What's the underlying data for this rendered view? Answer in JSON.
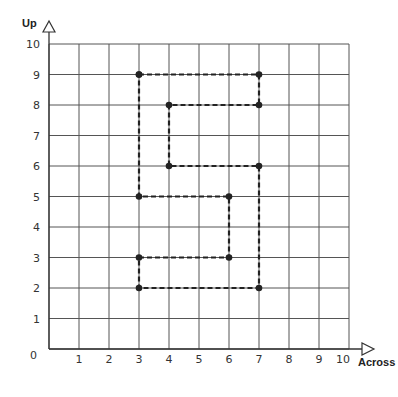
{
  "heading": "",
  "chart_data": {
    "type": "line",
    "title": "",
    "xlabel": "Across",
    "ylabel": "Up",
    "xlim": [
      0,
      10
    ],
    "ylim": [
      0,
      10
    ],
    "grid": true,
    "x_ticks": [
      "0",
      "1",
      "2",
      "3",
      "4",
      "5",
      "6",
      "7",
      "8",
      "9",
      "10"
    ],
    "y_ticks": [
      "0",
      "1",
      "2",
      "3",
      "4",
      "5",
      "6",
      "7",
      "8",
      "9",
      "10"
    ],
    "line_style": "dashed",
    "closed": true,
    "series": [
      {
        "name": "shape",
        "points": [
          [
            3,
            9
          ],
          [
            7,
            9
          ],
          [
            7,
            8
          ],
          [
            4,
            8
          ],
          [
            4,
            6
          ],
          [
            7,
            6
          ],
          [
            7,
            2
          ],
          [
            3,
            2
          ],
          [
            3,
            3
          ],
          [
            6,
            3
          ],
          [
            6,
            5
          ],
          [
            3,
            5
          ],
          [
            3,
            9
          ]
        ]
      }
    ]
  }
}
